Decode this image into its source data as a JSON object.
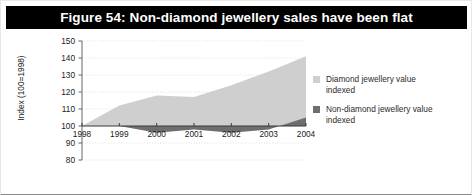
{
  "figure": {
    "title": "Figure 54: Non-diamond jewellery sales have been flat",
    "title_band_color": "#000000",
    "title_text_color": "#ffffff",
    "background_color": "#ffffff"
  },
  "legend": {
    "position": "right",
    "entries": [
      {
        "label": "Diamond jewellery value indexed",
        "color": "#cfcfcf",
        "swatch_name": "diamond-series-swatch"
      },
      {
        "label": "Non-diamond jewellery value indexed",
        "color": "#6e6e6e",
        "swatch_name": "non-diamond-series-swatch"
      }
    ]
  },
  "chart_data": {
    "type": "area",
    "title": "Figure 54: Non-diamond jewellery sales have been flat",
    "xlabel": "",
    "ylabel": "Index (100=1998)",
    "categories": [
      "1998",
      "1999",
      "2000",
      "2001",
      "2002",
      "2003",
      "2004"
    ],
    "x": [
      1998,
      1999,
      2000,
      2001,
      2002,
      2003,
      2004
    ],
    "series": [
      {
        "name": "Diamond jewellery value indexed",
        "color": "#cfcfcf",
        "values": [
          100,
          112,
          118,
          117,
          124,
          132,
          141
        ]
      },
      {
        "name": "Non-diamond jewellery value indexed",
        "color": "#6e6e6e",
        "values": [
          100,
          100,
          96,
          98,
          96,
          98,
          105
        ]
      }
    ],
    "ylim": [
      80,
      150
    ],
    "yticks": [
      80,
      90,
      100,
      110,
      120,
      130,
      140,
      150
    ],
    "ytick_labels": [
      "80",
      "90",
      "100",
      "110",
      "120",
      "130",
      "140",
      "150"
    ],
    "xticks": [
      1998,
      1999,
      2000,
      2001,
      2002,
      2003,
      2004
    ],
    "xtick_labels": [
      "1998",
      "1999",
      "2000",
      "2001",
      "2002",
      "2003",
      "2004"
    ],
    "grid": true,
    "grid_color": "#cccccc",
    "axis_color": "#666666",
    "baseline_value": 100
  }
}
